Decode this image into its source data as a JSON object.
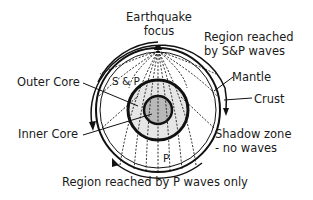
{
  "diagram": {
    "labels": {
      "focus_line1": "Earthquake",
      "focus_line2": "focus",
      "region_sp_line1": "Region reached",
      "region_sp_line2": "by S&P waves",
      "mantle": "Mantle",
      "crust": "Crust",
      "outer_core": "Outer Core",
      "inner_core": "Inner Core",
      "sp_inner": "S & P",
      "p_inner": "P",
      "shadow_line1": "Shadow zone",
      "shadow_line2": "- no waves",
      "region_p": "Region reached by P waves only"
    },
    "colors": {
      "stroke": "#111111",
      "outer_core_fill": "#e6e6e6",
      "inner_core_fill": "#b8b8b8"
    }
  }
}
